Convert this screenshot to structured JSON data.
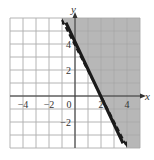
{
  "chart_data": {
    "type": "line",
    "title": "",
    "xlabel": "x",
    "ylabel": "y",
    "xlim": [
      -5,
      5
    ],
    "ylim": [
      -4,
      6
    ],
    "grid": true,
    "x_tick_labels": [
      "-4",
      "-2",
      "0",
      "2",
      "4"
    ],
    "y_tick_labels": [
      "4",
      "2",
      "-2"
    ],
    "series": [
      {
        "name": "boundary",
        "style": "dashed",
        "equation": "y = -2x + 4",
        "x": [
          -1,
          4
        ],
        "y": [
          6,
          -4
        ]
      }
    ],
    "shaded_region": "y > -2x + 4 (right of dashed line)",
    "colors": {
      "shade": "#b3b3b3",
      "grid": "#cccccc",
      "axis": "#333333",
      "line": "#1a1a1a"
    }
  },
  "labels": {
    "x_axis": "x",
    "y_axis": "y",
    "x_ticks": [
      {
        "text": "−4",
        "value": -4
      },
      {
        "text": "−2",
        "value": -2
      },
      {
        "text": "0",
        "value": 0
      },
      {
        "text": "2",
        "value": 2
      },
      {
        "text": "4",
        "value": 4
      }
    ],
    "y_ticks": [
      {
        "text": "4",
        "value": 4
      },
      {
        "text": "2",
        "value": 2
      },
      {
        "text": "−2",
        "value": -2
      }
    ]
  }
}
